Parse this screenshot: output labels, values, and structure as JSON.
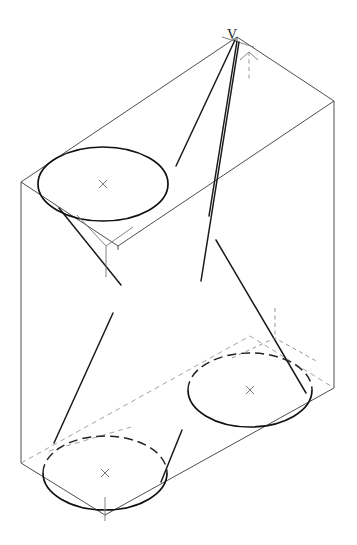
{
  "figure": {
    "type": "descriptive-geometry-line-drawing",
    "background_color": "#ffffff",
    "line_color": "#1a1a1a",
    "construction_line_color": "#777777",
    "hidden_line_color": "#888888"
  },
  "labels": {
    "apex": "V"
  },
  "geometry": {
    "box": {
      "name": "parallelepiped",
      "top_face": [
        [
          21,
          182
        ],
        [
          237,
          37
        ],
        [
          334,
          101
        ],
        [
          118,
          246
        ]
      ],
      "bottom_face": [
        [
          21,
          463
        ],
        [
          105,
          515
        ],
        [
          334,
          388
        ],
        [
          250,
          336
        ]
      ],
      "vertical_edge_left": [
        [
          21,
          182
        ],
        [
          21,
          463
        ]
      ],
      "vertical_edge_right": [
        [
          334,
          101
        ],
        [
          334,
          388
        ]
      ],
      "vertical_edge_front": [
        [
          105,
          230
        ],
        [
          105,
          515
        ]
      ],
      "back_vertical_edge": [
        [
          237,
          37
        ],
        [
          237,
          60
        ]
      ]
    },
    "cones": [
      {
        "id": "cone-top-left",
        "base_center": [
          103,
          184
        ],
        "base_rx": 65,
        "base_ry": 37,
        "base_visibility": "solid",
        "center_mark": "x"
      },
      {
        "id": "cone-bottom-left",
        "base_center": [
          105,
          473
        ],
        "base_rx": 62,
        "base_ry": 37,
        "base_visibility": "upper-arc-hidden",
        "center_mark": "x"
      },
      {
        "id": "cone-bottom-right",
        "base_center": [
          250,
          390
        ],
        "base_rx": 62,
        "base_ry": 37,
        "base_visibility": "upper-arc-hidden",
        "center_mark": "x"
      }
    ],
    "generators": [
      {
        "id": "gen-v-to-topleft-left",
        "from": [
          235,
          40
        ],
        "to": [
          176,
          165
        ]
      },
      {
        "id": "gen-v-to-topleft-right",
        "from": [
          237,
          41
        ],
        "to": [
          207,
          215
        ]
      },
      {
        "id": "gen-v-long-right",
        "from": [
          238,
          42
        ],
        "to": [
          200,
          280
        ]
      },
      {
        "id": "gen-topleft-lower-left",
        "from": [
          59,
          208
        ],
        "to": [
          120,
          284
        ]
      },
      {
        "id": "gen-bottomleft-left",
        "from": [
          112,
          314
        ],
        "to": [
          54,
          442
        ]
      },
      {
        "id": "gen-bottomleft-right",
        "from": [
          181,
          431
        ],
        "to": [
          160,
          481
        ]
      },
      {
        "id": "gen-bottomright-upper",
        "from": [
          215,
          239
        ],
        "to": [
          305,
          392
        ]
      }
    ],
    "center_marks_glyph": "x"
  },
  "annotations": {
    "apex_tick_vertical_dashed": [
      [
        249,
        48
      ],
      [
        249,
        78
      ]
    ],
    "apex_tick_cross": [
      [
        224,
        38
      ],
      [
        252,
        46
      ]
    ],
    "corner_tick_topleft_y": [
      [
        106,
        246
      ],
      [
        106,
        277
      ]
    ],
    "corner_tick_bottom_y": [
      [
        105,
        500
      ],
      [
        105,
        520
      ]
    ],
    "corner_tick_bottomright_y": [
      [
        275,
        310
      ],
      [
        275,
        340
      ]
    ]
  }
}
